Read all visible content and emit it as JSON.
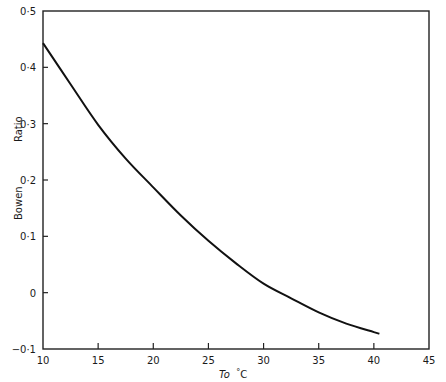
{
  "chart_data": {
    "type": "line",
    "title": "",
    "xlabel": "To °C",
    "xlabel_main": "To",
    "xlabel_unit": "°C",
    "ylabel": "Bowen Ratio",
    "ylabel_parts": [
      "Bowen",
      "Ratio"
    ],
    "xlim": [
      10,
      45
    ],
    "ylim": [
      -0.1,
      0.5
    ],
    "grid": false,
    "legend": null,
    "x_ticks": [
      "10",
      "15",
      "20",
      "25",
      "30",
      "35",
      "40",
      "45"
    ],
    "y_ticks": [
      "0·5",
      "0·4",
      "0·3",
      "0·2",
      "0·1",
      "0",
      "−0·1"
    ],
    "series": [
      {
        "name": "Bowen ratio",
        "x": [
          10,
          12.5,
          15,
          17.5,
          20,
          22.5,
          25,
          27.5,
          30,
          32.5,
          35,
          37.5,
          40,
          40.5
        ],
        "values": [
          0.443,
          0.37,
          0.298,
          0.238,
          0.187,
          0.137,
          0.092,
          0.052,
          0.016,
          -0.01,
          -0.035,
          -0.055,
          -0.07,
          -0.073
        ]
      }
    ]
  }
}
